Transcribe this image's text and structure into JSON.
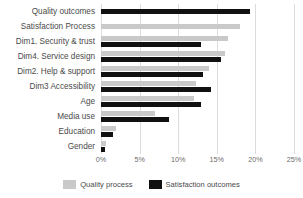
{
  "chart_data": {
    "type": "bar",
    "orientation": "horizontal",
    "title": "",
    "xlabel": "",
    "ylabel": "",
    "xlim": [
      0,
      25
    ],
    "x_tick_labels": [
      "0%",
      "5%",
      "10%",
      "15%",
      "20%",
      "25%"
    ],
    "x_ticks": [
      0,
      5,
      10,
      15,
      20,
      25
    ],
    "grid": true,
    "legend_position": "bottom",
    "categories": [
      "Quality outcomes",
      "Satisfaction Process",
      "Dim1. Security & trust",
      "Dim4. Service design",
      "Dim2. Help & support",
      "Dim3 Accessibility",
      "Age",
      "Media use",
      "Education",
      "Gender"
    ],
    "series": [
      {
        "name": "Quality process",
        "color": "#c9c9c9",
        "values": [
          null,
          18.0,
          16.5,
          16.0,
          14.0,
          12.3,
          12.0,
          7.0,
          2.0,
          0.6
        ]
      },
      {
        "name": "Satisfaction outcomes",
        "color": "#111111",
        "values": [
          19.3,
          null,
          13.0,
          15.5,
          13.2,
          14.3,
          13.0,
          8.8,
          1.6,
          0.5
        ]
      }
    ]
  }
}
